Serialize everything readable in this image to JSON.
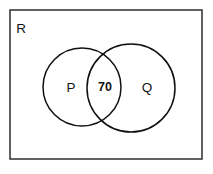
{
  "diagram": {
    "kind": "venn-diagram",
    "universe": {
      "label": "R",
      "label_x": 21,
      "label_y": 29
    },
    "sets": [
      {
        "name": "set-p",
        "label": "P",
        "label_x": 71,
        "label_y": 88,
        "cx": 82,
        "cy": 87,
        "r": 39
      },
      {
        "name": "set-q",
        "label": "Q",
        "label_x": 147,
        "label_y": 88,
        "cx": 131,
        "cy": 88,
        "r": 44
      }
    ],
    "regions": [
      {
        "name": "intersection",
        "label": "70",
        "label_x": 105,
        "label_y": 88,
        "value": 70
      }
    ],
    "colors": {
      "background": "#ffffff",
      "frame_stroke": "#3a3a3a",
      "circle_stroke": "#111111",
      "text": "#141414"
    },
    "frame": {
      "x": 10,
      "y": 10,
      "width": 192,
      "height": 149
    }
  }
}
